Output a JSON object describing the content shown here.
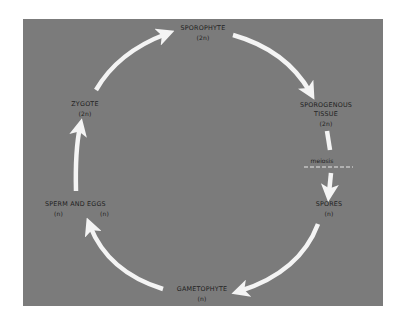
{
  "diagram": {
    "colors": {
      "panel": "#7b7b7b",
      "arrow": "#f4f4f4",
      "text": "#1e1e1e",
      "background": "#ffffff"
    },
    "nodes": {
      "sporophyte": {
        "name": "SPOROPHYTE",
        "ploidy": "(2n)"
      },
      "sporogenous_tissue": {
        "name_line1": "SPOROGENOUS",
        "name_line2": "TISSUE",
        "ploidy": "(2n)"
      },
      "spores": {
        "name": "SPORES",
        "ploidy": "(n)"
      },
      "gametophyte": {
        "name": "GAMETOPHYTE",
        "ploidy": "(n)"
      },
      "sperm_and_eggs": {
        "name": "SPERM AND EGGS",
        "ploidy_sperm": "(n)",
        "ploidy_eggs": "(n)"
      },
      "zygote": {
        "name": "ZYGOTE",
        "ploidy": "(2n)"
      }
    },
    "annotations": {
      "meiosis": "meiosis"
    },
    "edges": [
      {
        "from": "ZYGOTE",
        "to": "SPOROPHYTE"
      },
      {
        "from": "SPOROPHYTE",
        "to": "SPOROGENOUS TISSUE"
      },
      {
        "from": "SPOROGENOUS TISSUE",
        "to": "SPORES",
        "via": "meiosis"
      },
      {
        "from": "SPORES",
        "to": "GAMETOPHYTE"
      },
      {
        "from": "GAMETOPHYTE",
        "to": "SPERM AND EGGS"
      },
      {
        "from": "SPERM AND EGGS",
        "to": "ZYGOTE"
      }
    ]
  }
}
